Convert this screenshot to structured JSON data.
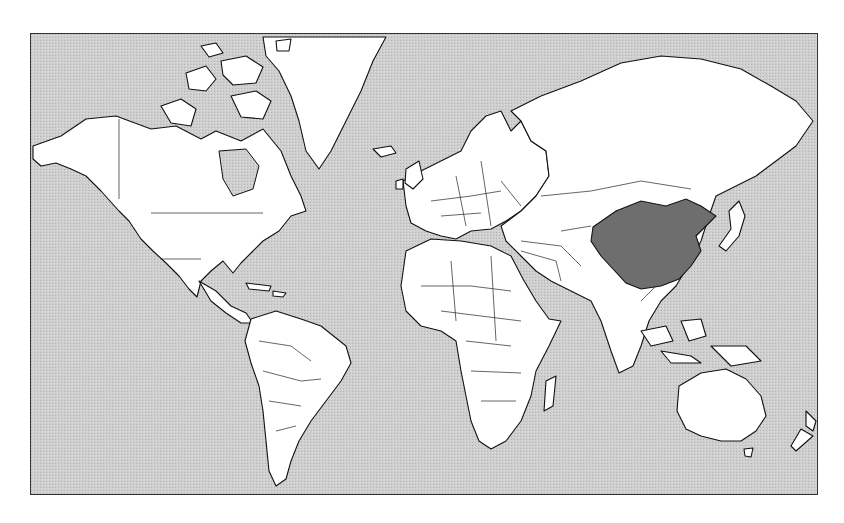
{
  "map": {
    "type": "world-political-outline",
    "projection": "mercator",
    "colors": {
      "ocean": "#c9c9c9",
      "land": "#ffffff",
      "outline": "#111111",
      "highlight": "#6e6e6e",
      "frame": "#333333"
    },
    "highlighted_countries": [
      "China"
    ]
  }
}
